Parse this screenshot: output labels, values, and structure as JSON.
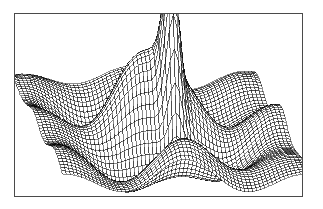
{
  "figure": {
    "title": "",
    "domain": "surface-wireframe-plot",
    "background_color": "#ffffff",
    "frame": {
      "visible": true,
      "color": "#4a4a4a",
      "line_width_px": 1,
      "x": 14,
      "y": 13,
      "width": 289,
      "height": 184
    }
  },
  "chart_data": {
    "type": "surface",
    "render_style": "wireframe-mesh",
    "title": "",
    "subtitle": "",
    "xlabel": "",
    "ylabel": "",
    "zlabel": "",
    "axes_visible": false,
    "grid": false,
    "legend": false,
    "tick_labels": [],
    "annotations": [],
    "line_color": "#000000",
    "fill_color": "#ffffff",
    "line_width": 0.45,
    "mesh": {
      "nu": 62,
      "nv": 62,
      "u_range": [
        -3.0,
        3.0
      ],
      "v_range": [
        -3.0,
        3.0
      ],
      "z_range": [
        -1.05,
        3.35
      ]
    },
    "projection": {
      "type": "oblique-perspective",
      "azimuth_deg": 0,
      "elevation_deg": 26,
      "x_scale": 41.0,
      "y_scale": 16.0,
      "z_scale": 40.0,
      "origin_x": 144,
      "origin_y": 118
    },
    "surface_terms": [
      {
        "name": "central-spike",
        "amplitude": 3.3,
        "cx": 0.3,
        "cy": 0.05,
        "sigma_x": 0.17,
        "sigma_y": 0.33
      },
      {
        "name": "ripple-cos-x",
        "amplitude": 0.72,
        "freq_x": 2.1,
        "freq_y": 0.0,
        "phase": 0.0
      },
      {
        "name": "ripple-cos-y",
        "amplitude": 0.44,
        "freq_x": 0.0,
        "freq_y": 2.35,
        "phase": 0.55
      },
      {
        "name": "ripple-cross",
        "amplitude": 0.3,
        "freq_x": 1.45,
        "freq_y": 1.7,
        "phase": 1.2
      },
      {
        "name": "left-hump",
        "amplitude": 0.95,
        "cx": -0.85,
        "cy": -0.35,
        "sigma_x": 0.62,
        "sigma_y": 0.8
      },
      {
        "name": "right-hump",
        "amplitude": 0.9,
        "cx": 1.05,
        "cy": -0.3,
        "sigma_x": 0.6,
        "sigma_y": 0.8
      },
      {
        "name": "front-trough",
        "amplitude": -0.95,
        "cx": -0.2,
        "cy": 0.95,
        "sigma_x": 0.78,
        "sigma_y": 0.62
      },
      {
        "name": "edge-decay",
        "amplitude": 1.0,
        "sigma_x": 2.4,
        "sigma_y": 2.4
      }
    ],
    "x": [
      -3.0,
      -2.5,
      -2.0,
      -1.5,
      -1.0,
      -0.5,
      0.0,
      0.5,
      1.0,
      1.5,
      2.0,
      2.5,
      3.0
    ],
    "y": [
      -3.0,
      -2.5,
      -2.0,
      -1.5,
      -1.0,
      -0.5,
      0.0,
      0.5,
      1.0,
      1.5,
      2.0,
      2.5,
      3.0
    ],
    "z_sample_rows": [
      [
        0.02,
        0.05,
        0.08,
        0.06,
        0.02,
        -0.01,
        0.0,
        0.03,
        0.05,
        0.04,
        0.02,
        0.01,
        0.0
      ],
      [
        0.06,
        0.18,
        0.3,
        0.26,
        0.1,
        -0.04,
        -0.02,
        0.12,
        0.24,
        0.18,
        0.08,
        0.03,
        0.01
      ],
      [
        0.12,
        0.38,
        0.66,
        0.58,
        0.22,
        -0.1,
        -0.06,
        0.28,
        0.55,
        0.42,
        0.18,
        0.06,
        0.02
      ],
      [
        0.16,
        0.52,
        0.92,
        0.8,
        0.3,
        -0.16,
        -0.08,
        0.4,
        0.78,
        0.58,
        0.24,
        0.08,
        0.02
      ],
      [
        0.18,
        0.58,
        1.02,
        0.88,
        0.32,
        -0.2,
        0.46,
        0.52,
        0.88,
        0.64,
        0.26,
        0.09,
        0.03
      ],
      [
        0.16,
        0.54,
        0.96,
        0.82,
        0.28,
        -0.24,
        2.35,
        0.48,
        0.82,
        0.6,
        0.24,
        0.08,
        0.02
      ],
      [
        0.12,
        0.44,
        0.78,
        0.66,
        0.2,
        -0.3,
        3.3,
        0.36,
        0.66,
        0.48,
        0.19,
        0.06,
        0.02
      ],
      [
        0.08,
        0.3,
        0.54,
        0.44,
        0.08,
        -0.44,
        1.9,
        0.2,
        0.44,
        0.32,
        0.12,
        0.04,
        0.01
      ],
      [
        0.04,
        0.16,
        0.28,
        0.2,
        -0.08,
        -0.68,
        0.3,
        0.02,
        0.22,
        0.16,
        0.06,
        0.02,
        0.0
      ],
      [
        0.01,
        0.06,
        0.1,
        0.04,
        -0.22,
        -0.88,
        -0.42,
        -0.18,
        0.06,
        0.06,
        0.02,
        0.01,
        0.0
      ],
      [
        0.0,
        0.02,
        0.02,
        -0.04,
        -0.28,
        -0.96,
        -0.7,
        -0.3,
        -0.02,
        0.02,
        0.01,
        0.0,
        0.0
      ],
      [
        0.0,
        0.0,
        0.0,
        -0.04,
        -0.2,
        -0.66,
        -0.52,
        -0.22,
        -0.02,
        0.0,
        0.0,
        0.0,
        0.0
      ],
      [
        0.0,
        0.0,
        0.0,
        -0.01,
        -0.06,
        -0.22,
        -0.18,
        -0.08,
        0.0,
        0.0,
        0.0,
        0.0,
        0.0
      ]
    ]
  }
}
